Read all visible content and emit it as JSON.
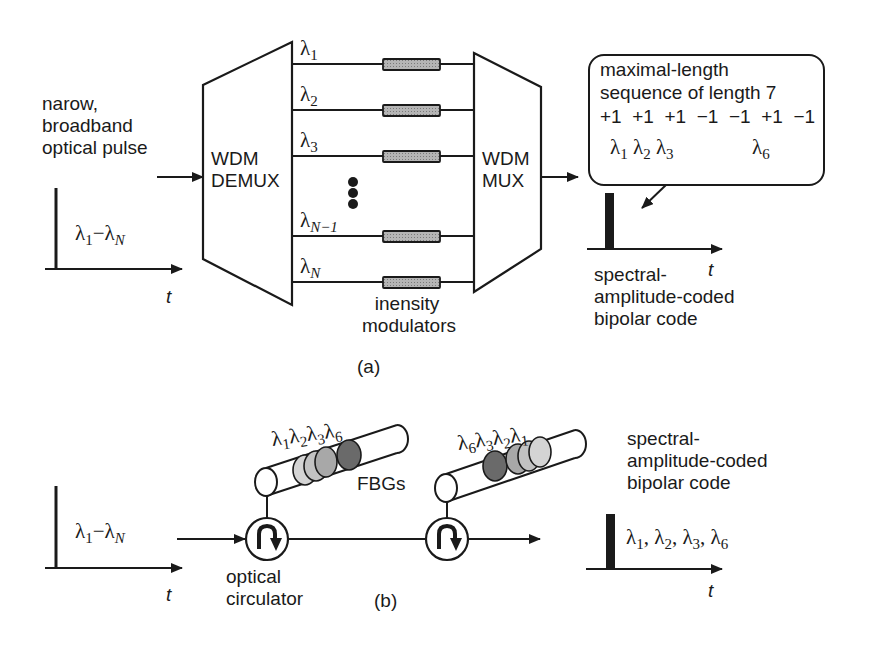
{
  "figure": {
    "panel_a": {
      "caption": "(a)",
      "input": {
        "label_lines": [
          "narow,",
          "broadband",
          "optical pulse"
        ],
        "pulse_band": {
          "from": "λ",
          "from_sub": "1",
          "dash": "−",
          "to": "λ",
          "to_sub": "N"
        },
        "time_axis": "t"
      },
      "demux": {
        "line1": "WDM",
        "line2": "DEMUX"
      },
      "mux": {
        "line1": "WDM",
        "line2": "MUX"
      },
      "channels": [
        {
          "sym": "λ",
          "sub": "1"
        },
        {
          "sym": "λ",
          "sub": "2"
        },
        {
          "sym": "λ",
          "sub": "3"
        },
        {
          "sym": "λ",
          "sub": "N−1"
        },
        {
          "sym": "λ",
          "sub": "N"
        }
      ],
      "ellipsis": "⋮",
      "modulators_label": [
        "inensity",
        "modulators"
      ],
      "callout": {
        "line1": "maximal-length",
        "line2": "sequence of length 7",
        "sequence": [
          "+1",
          "+1",
          "+1",
          "−1",
          "−1",
          "+1",
          "−1"
        ],
        "selected": [
          {
            "sym": "λ",
            "sub": "1"
          },
          {
            "sym": "λ",
            "sub": "2"
          },
          {
            "sym": "λ",
            "sub": "3"
          },
          {
            "sym": "λ",
            "sub": "6"
          }
        ]
      },
      "output": {
        "label_lines": [
          "spectral-",
          "amplitude-coded",
          "bipolar code"
        ],
        "time_axis": "t"
      }
    },
    "panel_b": {
      "caption": "(b)",
      "input": {
        "pulse_band": {
          "from": "λ",
          "from_sub": "1",
          "dash": "−",
          "to": "λ",
          "to_sub": "N"
        },
        "time_axis": "t"
      },
      "circulator_label": [
        "optical",
        "circulator"
      ],
      "fbg_label": "FBGs",
      "fbg1": [
        {
          "sym": "λ",
          "sub": "1",
          "color": "#d4d4d4"
        },
        {
          "sym": "λ",
          "sub": "2",
          "color": "#c2c2c2"
        },
        {
          "sym": "λ",
          "sub": "3",
          "color": "#a8a8a8"
        },
        {
          "sym": "λ",
          "sub": "6",
          "color": "#6a6a6a"
        }
      ],
      "fbg2": [
        {
          "sym": "λ",
          "sub": "6",
          "color": "#6a6a6a"
        },
        {
          "sym": "λ",
          "sub": "3",
          "color": "#a8a8a8"
        },
        {
          "sym": "λ",
          "sub": "2",
          "color": "#c2c2c2"
        },
        {
          "sym": "λ",
          "sub": "1",
          "color": "#d4d4d4"
        }
      ],
      "output": {
        "label_lines": [
          "spectral-",
          "amplitude-coded",
          "bipolar code"
        ],
        "wavelengths": "λ₁, λ₂, λ₃, λ₆",
        "wl": [
          {
            "sym": "λ",
            "sub": "1",
            "sep": ", "
          },
          {
            "sym": "λ",
            "sub": "2",
            "sep": ", "
          },
          {
            "sym": "λ",
            "sub": "3",
            "sep": ", "
          },
          {
            "sym": "λ",
            "sub": "6",
            "sep": ""
          }
        ],
        "time_axis": "t"
      }
    }
  },
  "colors": {
    "ink": "#1a1a1a",
    "modulator_fill": "#a9a9a9",
    "background": "#ffffff"
  }
}
